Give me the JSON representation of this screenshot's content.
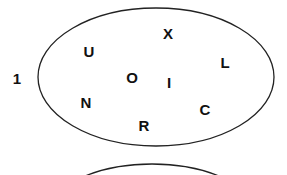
{
  "diagram": {
    "colors": {
      "stroke": "#222222",
      "text": "#111111",
      "background": "#ffffff"
    },
    "sets": [
      {
        "label": "1",
        "label_pos": {
          "x": 17,
          "y": 84
        },
        "ellipse": {
          "cx": 156,
          "cy": 77,
          "rx": 118,
          "ry": 69
        },
        "letters": [
          {
            "text": "X",
            "x": 168,
            "y": 39
          },
          {
            "text": "U",
            "x": 89,
            "y": 57
          },
          {
            "text": "L",
            "x": 225,
            "y": 68
          },
          {
            "text": "O",
            "x": 132,
            "y": 83
          },
          {
            "text": "I",
            "x": 169,
            "y": 88
          },
          {
            "text": "N",
            "x": 86,
            "y": 108
          },
          {
            "text": "C",
            "x": 205,
            "y": 115
          },
          {
            "text": "R",
            "x": 144,
            "y": 131
          }
        ]
      },
      {
        "label": "",
        "ellipse": {
          "cx": 152,
          "cy": 233,
          "rx": 118,
          "ry": 69
        },
        "letters": []
      }
    ]
  }
}
